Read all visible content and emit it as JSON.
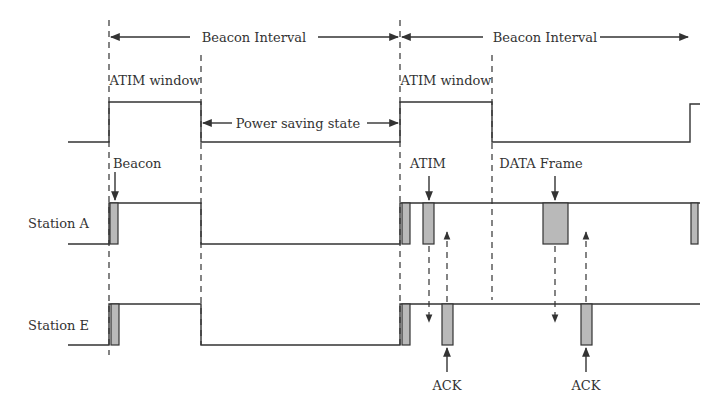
{
  "diagram": {
    "title_labels": {
      "beacon_interval_1": "Beacon Interval",
      "beacon_interval_2": "Beacon Interval",
      "atim_window_1": "ATIM window",
      "atim_window_2": "ATIM window",
      "power_saving_state": "Power saving state"
    },
    "stations": [
      {
        "name": "Station A"
      },
      {
        "name": "Station E"
      }
    ],
    "frame_labels": {
      "beacon": "Beacon",
      "atim": "ATIM",
      "data_frame": "DATA Frame",
      "ack_1": "ACK",
      "ack_2": "ACK"
    },
    "colors": {
      "line": "#333333",
      "frame_fill": "#b9b9b9",
      "background": "#ffffff"
    }
  }
}
